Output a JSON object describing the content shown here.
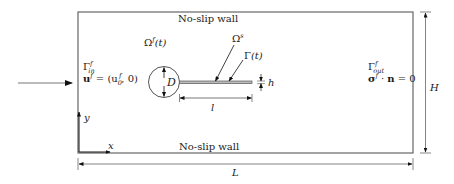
{
  "diagram": {
    "walls": {
      "top_label": "No-slip wall",
      "bottom_label": "No-slip wall"
    },
    "domains": {
      "fluid": {
        "symbol": "Ω",
        "sup": "f",
        "arg": "(t)"
      },
      "solid": {
        "symbol": "Ω",
        "sup": "s"
      },
      "interface": {
        "symbol": "Γ",
        "arg": "(t)"
      }
    },
    "inlet": {
      "boundary_symbol": "Γ",
      "boundary_sup": "f",
      "boundary_sub": "in",
      "condition_lhs": "u",
      "condition_lhs_sup": "f",
      "condition_rhs_pre": " = (u",
      "condition_rhs_sub": "0",
      "condition_rhs_sup": "f",
      "condition_rhs_post": ", 0)"
    },
    "outlet": {
      "boundary_symbol": "Γ",
      "boundary_sup": "f",
      "boundary_sub": "out",
      "condition_lhs": "σ",
      "condition_lhs_sup": "f",
      "condition_mid": " · ",
      "condition_n": "n",
      "condition_rhs": " = 0"
    },
    "dimensions": {
      "cylinder_diameter": "D",
      "flag_length": "l",
      "flag_thickness": "h",
      "channel_length": "L",
      "channel_height": "H"
    },
    "axes": {
      "x": "x",
      "y": "y"
    },
    "colors": {
      "stroke": "#555555",
      "text": "#1a1a1a",
      "arrow": "#111111"
    }
  }
}
